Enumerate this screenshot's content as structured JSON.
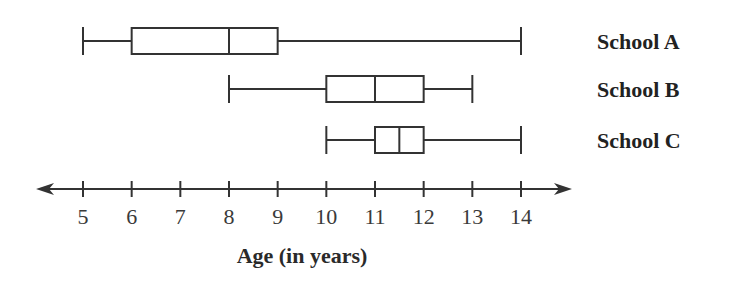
{
  "chart_data": {
    "type": "boxplot",
    "title": "",
    "xlabel": "Age (in years)",
    "ylabel": "",
    "xlim": [
      5,
      14
    ],
    "ticks": [
      5,
      6,
      7,
      8,
      9,
      10,
      11,
      12,
      13,
      14
    ],
    "tick_labels": [
      "5",
      "6",
      "7",
      "8",
      "9",
      "10",
      "11",
      "12",
      "13",
      "14"
    ],
    "axis_arrows": "both",
    "grid": false,
    "series": [
      {
        "name": "School A",
        "min": 5,
        "q1": 6,
        "median": 8,
        "q3": 9,
        "max": 14
      },
      {
        "name": "School B",
        "min": 8,
        "q1": 10,
        "median": 11,
        "q3": 12,
        "max": 13
      },
      {
        "name": "School C",
        "min": 10,
        "q1": 11,
        "median": 11.5,
        "q3": 12,
        "max": 14
      }
    ],
    "colors": {
      "stroke": "#333333",
      "text": "#222222"
    }
  }
}
